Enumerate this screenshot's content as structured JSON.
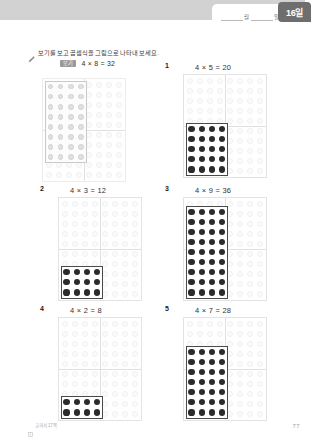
{
  "header": {
    "month_unit": "월",
    "day_unit": "일",
    "month_value": "",
    "day_value": "",
    "day_badge": "16일"
  },
  "instruction": {
    "icon": "pencil-icon",
    "text": "보기를 보고 곱셈식을 그림으로 나타내 보세요."
  },
  "example": {
    "tag": "보기",
    "equation": "4 × 8 = 32",
    "cols": 4,
    "rows": 8,
    "anchor": "top-left"
  },
  "board": {
    "grid_cols": 8,
    "grid_rows": 10,
    "dot_color": "#2b2b2b",
    "ghost_color": "#fbfbfb",
    "outline_color": "#4a4a4a"
  },
  "problems": [
    {
      "number": "1",
      "equation": "4 × 5 = 20",
      "cols": 4,
      "rows": 5
    },
    {
      "number": "2",
      "equation": "4 × 3 = 12",
      "cols": 4,
      "rows": 3
    },
    {
      "number": "3",
      "equation": "4 × 9 = 36",
      "cols": 4,
      "rows": 9
    },
    {
      "number": "4",
      "equation": "4 × 2 = 8",
      "cols": 4,
      "rows": 2
    },
    {
      "number": "5",
      "equation": "4 × 7 = 28",
      "cols": 4,
      "rows": 7
    }
  ],
  "footer": {
    "note": "교과서 17쪽",
    "page_number": "77"
  }
}
